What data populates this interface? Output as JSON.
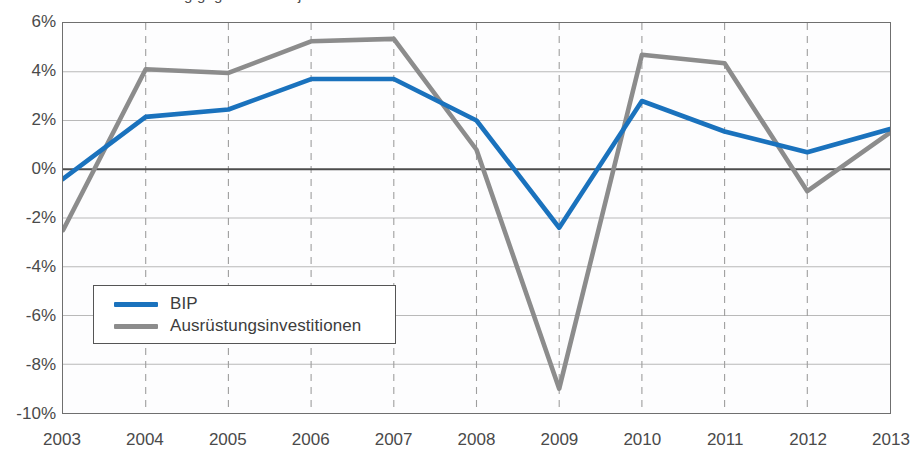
{
  "chart_data": {
    "type": "line",
    "title": "Reale Veränderung gegenüber Vorjahr",
    "xlabel": "",
    "ylabel": "",
    "x": [
      "2003",
      "2004",
      "2005",
      "2006",
      "2007",
      "2008",
      "2009",
      "2010",
      "2011",
      "2012",
      "2013"
    ],
    "categories": [
      "2003",
      "2004",
      "2005",
      "2006",
      "2007",
      "2008",
      "2009",
      "2010",
      "2011",
      "2012",
      "2013"
    ],
    "ylim": [
      -10,
      6
    ],
    "yticks": [
      6,
      4,
      2,
      0,
      -2,
      -4,
      -6,
      -8,
      -10
    ],
    "ytick_labels": [
      "6%",
      "4%",
      "2%",
      "0%",
      "-2%",
      "-4%",
      "-6%",
      "-8%",
      "-10%"
    ],
    "grid": true,
    "grid_style": "horizontal solid, vertical dashed",
    "legend_position": "lower left",
    "zero_line": 0,
    "series": [
      {
        "name": "BIP",
        "color": "#1a72bd",
        "values": [
          -0.4,
          2.15,
          2.45,
          3.7,
          3.7,
          2.0,
          -2.4,
          2.8,
          1.55,
          0.7,
          1.65
        ]
      },
      {
        "name": "Ausrüstungsinvestitionen",
        "color": "#8c8c8c",
        "values": [
          -2.5,
          4.1,
          3.95,
          5.25,
          5.35,
          0.8,
          -9.0,
          4.7,
          4.35,
          -0.9,
          1.5
        ]
      }
    ]
  },
  "legend": {
    "items": [
      {
        "label": "BIP",
        "color": "#1a72bd"
      },
      {
        "label": "Ausrüstungsinvestitionen",
        "color": "#8c8c8c"
      }
    ]
  },
  "colors": {
    "bip": "#1a72bd",
    "ausruestung": "#8c8c8c",
    "axis": "#6f6f6f",
    "gridline": "#b9b9b9",
    "gridline_dashed": "#9e9e9e",
    "zero_line": "#4d4d4d",
    "text": "#4a4a4a",
    "plot_background": "#fdfdfe"
  }
}
